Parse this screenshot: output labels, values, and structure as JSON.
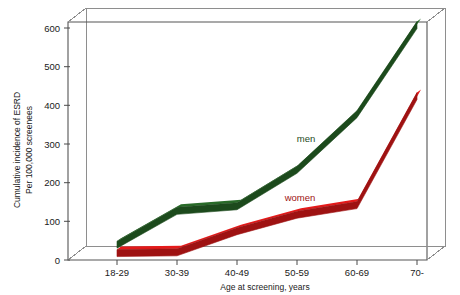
{
  "chart_data": {
    "type": "line",
    "title": "",
    "subtitle": "",
    "xlabel": "Age at screening, years",
    "ylabel_line1": "Cumulative incidence of ESRD",
    "ylabel_line2": "Per 100,000 screenees",
    "categories": [
      "18-29",
      "30-39",
      "40-49",
      "50-59",
      "60-69",
      "70-"
    ],
    "ylim": [
      0,
      620
    ],
    "yticks": [
      0,
      100,
      200,
      300,
      400,
      500,
      600
    ],
    "ytick_labels": [
      "0",
      "100",
      "200",
      "300",
      "400",
      "500",
      "600"
    ],
    "grid": false,
    "legend_position": "inline-annotation",
    "style": "3d-ribbon",
    "series": [
      {
        "name": "men",
        "color": "#1c4a1c",
        "label_text": "men",
        "values": [
          40,
          128,
          140,
          235,
          380,
          612
        ]
      },
      {
        "name": "women",
        "color": "#9e1212",
        "label_text": "women",
        "values": [
          18,
          20,
          75,
          118,
          143,
          427
        ]
      }
    ],
    "annotations": [
      {
        "text": "men",
        "series": "men",
        "color": "#1c4a1c"
      },
      {
        "text": "women",
        "series": "women",
        "color": "#9e1212"
      }
    ]
  },
  "figure": {
    "background": "#ffffff",
    "frame_color": "#8e8e8e",
    "text_color": "#1a1a1a"
  }
}
